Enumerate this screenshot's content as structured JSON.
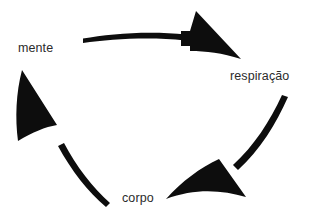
{
  "diagram": {
    "background_color": "#ffffff",
    "arrow_color": "#0d0d0d",
    "label_color": "#2b2b2b",
    "direction": "clockwise",
    "nodes": [
      {
        "id": "mente",
        "label": "mente",
        "position": "upper-left"
      },
      {
        "id": "respiracao",
        "label": "respiração",
        "position": "right"
      },
      {
        "id": "corpo",
        "label": "corpo",
        "position": "bottom-center"
      }
    ],
    "arrows": [
      {
        "id": "mente-to-respiracao",
        "from": "mente",
        "to": "respiração",
        "position": "top"
      },
      {
        "id": "respiracao-to-corpo",
        "from": "respiração",
        "to": "corpo",
        "position": "right"
      },
      {
        "id": "corpo-to-mente",
        "from": "corpo",
        "to": "mente",
        "position": "left"
      }
    ]
  }
}
